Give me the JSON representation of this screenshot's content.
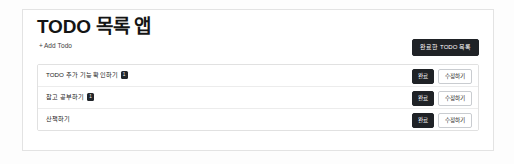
{
  "app": {
    "title": "TODO 목록 앱"
  },
  "toolbar": {
    "add_todo_plus": "+",
    "add_todo_label": "Add Todo",
    "completed_list_label": "완료한 TODO 목록"
  },
  "actions": {
    "done_label": "완료",
    "edit_label": "수정하기"
  },
  "todos": [
    {
      "text": "TODO 추가 기능 확인하기",
      "badge": "1",
      "has_badge": true
    },
    {
      "text": "참고 공부하기",
      "badge": "1",
      "has_badge": true
    },
    {
      "text": "산책하기",
      "badge": "",
      "has_badge": false
    }
  ],
  "colors": {
    "dark_button": "#1f2226",
    "page_background": "#fdfdfd",
    "card_border": "#e3e3e3",
    "row_divider": "#ececec",
    "text_primary": "#222222"
  }
}
